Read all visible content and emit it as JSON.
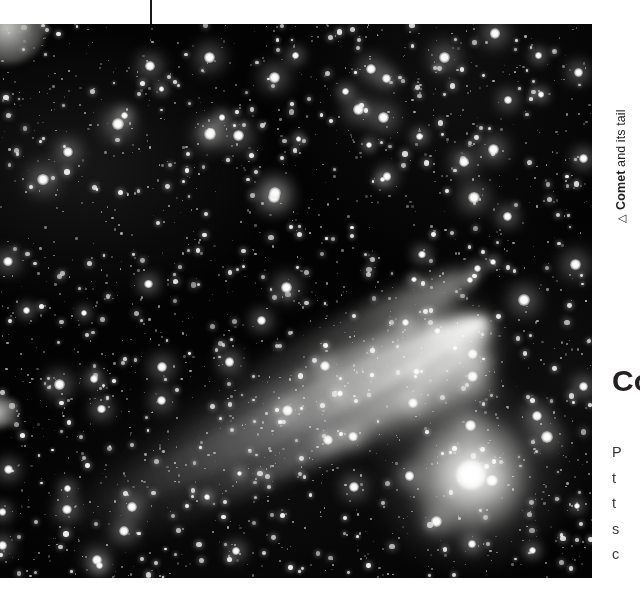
{
  "page": {
    "background_color": "#ffffff",
    "width": 640,
    "height": 603
  },
  "crop_mark": {
    "name": "registration-mark",
    "color": "#1a1a1a"
  },
  "photograph": {
    "subject": "Comet with broad dust tail against a dense star field",
    "alt_text": "Black and white astronomical photograph of a bright comet with a long fanned dust tail streaming toward the upper left across a field of stars",
    "background_color": "#030303",
    "highlight_color": "#ffffff",
    "nucleus_color": "#ffffff",
    "tail_color": "#d0d0cc"
  },
  "caption": {
    "marker": "△",
    "bold_text": "Comet",
    "rest_text": " and its tail",
    "color": "#231f20"
  },
  "side_column": {
    "heading": "Co",
    "body_lines": [
      "P",
      "t",
      "t",
      "s",
      "c"
    ],
    "heading_color": "#231f20",
    "body_color": "#3a3a3c"
  }
}
